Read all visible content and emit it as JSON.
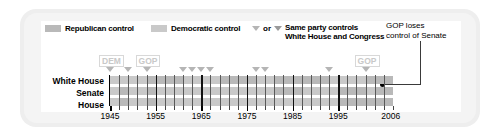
{
  "legend": {
    "republican_label": "Republican control",
    "democratic_label": "Democratic control",
    "or_label": "or",
    "same_party_line1": "Same party controls",
    "same_party_line2": "White House and Congress",
    "republican_color": "#b9b9b9",
    "democratic_color": "#c9c9c9"
  },
  "callout": {
    "line1": "GOP loses",
    "line2": "control of Senate"
  },
  "tags": [
    {
      "label": "DEM",
      "year": 1945
    },
    {
      "label": "GOP",
      "year": 1953
    },
    {
      "label": "GOP",
      "year": 2001
    }
  ],
  "rows": [
    {
      "label": "White House"
    },
    {
      "label": "Senate"
    },
    {
      "label": "House"
    }
  ],
  "chart_data": {
    "type": "bar",
    "xlabel": "",
    "ylabel": "",
    "xlim": [
      1945,
      2007
    ],
    "grid": true,
    "legend": [
      "Republican control",
      "Democratic control"
    ],
    "tick_labels": [
      "1945",
      "1955",
      "1965",
      "1975",
      "1985",
      "1995",
      "2006"
    ],
    "tick_years": [
      1945,
      1955,
      1965,
      1975,
      1985,
      1995,
      2006
    ],
    "minor_tick_interval_years": 2,
    "decade_gridline_years": [
      1945,
      1955,
      1965,
      1975,
      1985,
      1995
    ],
    "series": [
      {
        "name": "White House",
        "segments": [
          {
            "start": 1945,
            "end": 1953,
            "party": "dem"
          },
          {
            "start": 1953,
            "end": 1961,
            "party": "rep"
          },
          {
            "start": 1961,
            "end": 1969,
            "party": "dem"
          },
          {
            "start": 1969,
            "end": 1977,
            "party": "rep"
          },
          {
            "start": 1977,
            "end": 1981,
            "party": "dem"
          },
          {
            "start": 1981,
            "end": 1993,
            "party": "rep"
          },
          {
            "start": 1993,
            "end": 2001,
            "party": "dem"
          },
          {
            "start": 2001,
            "end": 2007,
            "party": "rep"
          }
        ]
      },
      {
        "name": "Senate",
        "segments": [
          {
            "start": 1945,
            "end": 1947,
            "party": "dem"
          },
          {
            "start": 1947,
            "end": 1949,
            "party": "rep"
          },
          {
            "start": 1949,
            "end": 1953,
            "party": "dem"
          },
          {
            "start": 1953,
            "end": 1955,
            "party": "rep"
          },
          {
            "start": 1955,
            "end": 1981,
            "party": "dem"
          },
          {
            "start": 1981,
            "end": 1987,
            "party": "rep"
          },
          {
            "start": 1987,
            "end": 1995,
            "party": "dem"
          },
          {
            "start": 1995,
            "end": 2001,
            "party": "rep"
          },
          {
            "start": 2001,
            "end": 2003,
            "party": "dem"
          },
          {
            "start": 2003,
            "end": 2007,
            "party": "rep"
          }
        ]
      },
      {
        "name": "House",
        "segments": [
          {
            "start": 1945,
            "end": 1947,
            "party": "dem"
          },
          {
            "start": 1947,
            "end": 1949,
            "party": "rep"
          },
          {
            "start": 1949,
            "end": 1953,
            "party": "dem"
          },
          {
            "start": 1953,
            "end": 1955,
            "party": "rep"
          },
          {
            "start": 1955,
            "end": 1995,
            "party": "dem"
          },
          {
            "start": 1995,
            "end": 2007,
            "party": "rep"
          }
        ]
      }
    ],
    "unified_government_markers": [
      1945,
      1949,
      1953,
      1961,
      1963,
      1965,
      1967,
      1977,
      1979,
      1993,
      2001
    ],
    "annotation_marker_year": 2001,
    "senate_flip_year": 2001
  }
}
